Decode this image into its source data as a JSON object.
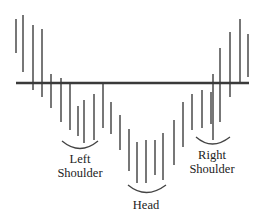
{
  "colors": {
    "bar": "#555555",
    "neckline": "#3a3a3a",
    "text": "#222222"
  },
  "neckline": {
    "x1": 16,
    "x2": 249,
    "y": 83
  },
  "bars": [
    {
      "x": 16,
      "y1": 19,
      "y2": 53
    },
    {
      "x": 23,
      "y1": 15,
      "y2": 72
    },
    {
      "x": 33,
      "y1": 25,
      "y2": 90
    },
    {
      "x": 42,
      "y1": 29,
      "y2": 97
    },
    {
      "x": 51,
      "y1": 74,
      "y2": 108
    },
    {
      "x": 61,
      "y1": 78,
      "y2": 122
    },
    {
      "x": 70,
      "y1": 84,
      "y2": 130
    },
    {
      "x": 78,
      "y1": 106,
      "y2": 136
    },
    {
      "x": 84,
      "y1": 100,
      "y2": 143
    },
    {
      "x": 94,
      "y1": 94,
      "y2": 140
    },
    {
      "x": 103,
      "y1": 84,
      "y2": 128
    },
    {
      "x": 111,
      "y1": 102,
      "y2": 134
    },
    {
      "x": 120,
      "y1": 115,
      "y2": 150
    },
    {
      "x": 129,
      "y1": 129,
      "y2": 171
    },
    {
      "x": 137,
      "y1": 142,
      "y2": 183
    },
    {
      "x": 146,
      "y1": 140,
      "y2": 183
    },
    {
      "x": 155,
      "y1": 140,
      "y2": 175
    },
    {
      "x": 163,
      "y1": 133,
      "y2": 180
    },
    {
      "x": 174,
      "y1": 120,
      "y2": 165
    },
    {
      "x": 183,
      "y1": 102,
      "y2": 147
    },
    {
      "x": 192,
      "y1": 94,
      "y2": 130
    },
    {
      "x": 202,
      "y1": 90,
      "y2": 128
    },
    {
      "x": 211,
      "y1": 92,
      "y2": 124
    },
    {
      "x": 213,
      "y1": 74,
      "y2": 140
    },
    {
      "x": 220,
      "y1": 48,
      "y2": 122
    },
    {
      "x": 230,
      "y1": 32,
      "y2": 97
    },
    {
      "x": 240,
      "y1": 19,
      "y2": 82
    },
    {
      "x": 248,
      "y1": 34,
      "y2": 77
    }
  ],
  "arcs": [
    {
      "name": "left-shoulder-arc",
      "d": "M62 141 Q 80 156 98 141"
    },
    {
      "name": "head-arc",
      "d": "M128 185 Q 146 200 166 185"
    },
    {
      "name": "right-shoulder-arc",
      "d": "M196 137 Q 212 151 230 137"
    }
  ],
  "labels": {
    "left_shoulder": {
      "line1": "Left",
      "line2": "Shoulder",
      "x": 80,
      "y1": 163,
      "y2": 177
    },
    "head": {
      "text": "Head",
      "x": 146,
      "y": 209
    },
    "right_shoulder": {
      "line1": "Right",
      "line2": "Shoulder",
      "x": 212,
      "y1": 159,
      "y2": 173
    }
  }
}
